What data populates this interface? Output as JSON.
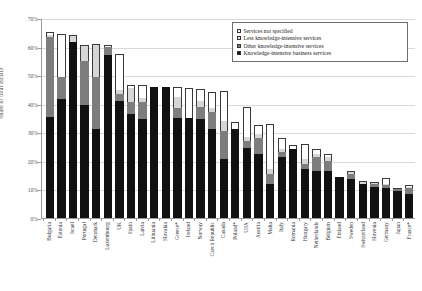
{
  "chart_data": {
    "type": "bar",
    "subtype": "stacked-column",
    "title": "",
    "xlabel": "",
    "ylabel": "Share of total BERD",
    "ylim": [
      0,
      70
    ],
    "ytick_labels": [
      "0%",
      "10%",
      "20%",
      "30%",
      "40%",
      "50%",
      "60%",
      "70%"
    ],
    "ytick_values": [
      0,
      10,
      20,
      30,
      40,
      50,
      60,
      70
    ],
    "grid": true,
    "legend_position": "top-right",
    "value_unit": "percent",
    "categories": [
      "Bulgaria",
      "Estonia",
      "Israel",
      "Portugal",
      "Denmark",
      "Luxembourg",
      "UK",
      "Spain",
      "Latvia",
      "Lithuania",
      "Slovakia",
      "Greece*",
      "Ireland",
      "Norway",
      "Czech Republic",
      "Canada",
      "Poland*",
      "USA",
      "Austria",
      "Malta",
      "Italy",
      "Romania",
      "Hungary",
      "Netherlands",
      "Belgium",
      "Finland",
      "Sweden",
      "Switzerland",
      "Slovenia",
      "Germany",
      "Japan",
      "France*"
    ],
    "series": [
      {
        "name": "Knowledge-intensive business services",
        "color": "#111111",
        "values": [
          35.5,
          41.8,
          61.5,
          39.5,
          31.0,
          57.0,
          40.8,
          36.5,
          34.5,
          45.8,
          45.8,
          35.0,
          35.0,
          34.5,
          31.0,
          20.5,
          31.0,
          24.5,
          22.5,
          12.0,
          21.5,
          24.0,
          17.0,
          16.5,
          16.5,
          14.5,
          13.5,
          12.0,
          11.0,
          10.5,
          9.5,
          8.5
        ]
      },
      {
        "name": "Other knowledge-intensive services",
        "color": "#7d7d7d",
        "values": [
          28.0,
          7.5,
          0.0,
          15.5,
          18.5,
          3.0,
          2.5,
          4.0,
          6.0,
          0.0,
          0.0,
          3.5,
          0.0,
          4.5,
          6.0,
          10.0,
          0.0,
          2.5,
          5.5,
          3.5,
          1.5,
          0.0,
          2.0,
          5.0,
          3.5,
          0.0,
          2.0,
          0.0,
          1.0,
          1.0,
          0.5,
          2.0
        ]
      },
      {
        "name": "Less knowledge-intensive services",
        "color": "#d6d6d6",
        "values": [
          0.5,
          0.0,
          2.5,
          5.5,
          11.5,
          0.0,
          1.5,
          5.0,
          1.5,
          0.0,
          0.0,
          4.0,
          0.0,
          2.0,
          1.5,
          3.5,
          0.0,
          1.5,
          1.5,
          1.5,
          1.0,
          0.0,
          1.5,
          1.0,
          1.5,
          0.0,
          1.0,
          1.0,
          0.5,
          0.5,
          0.5,
          0.5
        ]
      },
      {
        "name": "Services not specified",
        "color": "#ffffff",
        "values": [
          1.0,
          15.0,
          0.0,
          0.0,
          0.0,
          0.5,
          12.5,
          1.0,
          4.5,
          0.0,
          0.0,
          3.5,
          10.5,
          4.0,
          5.5,
          10.5,
          2.5,
          10.5,
          3.0,
          16.0,
          4.0,
          1.5,
          5.5,
          1.5,
          1.0,
          0.0,
          0.0,
          0.0,
          0.0,
          2.0,
          0.0,
          0.5
        ]
      }
    ]
  },
  "legend": {
    "items": [
      {
        "label": "Services not specified",
        "swatch": "sw-ns"
      },
      {
        "label": "Less knowledge-intensive services",
        "swatch": "sw-less"
      },
      {
        "label": "Other knowledge-intensive services",
        "swatch": "sw-other"
      },
      {
        "label": "Knowledge-intensive business services",
        "swatch": "sw-kibs"
      }
    ]
  }
}
